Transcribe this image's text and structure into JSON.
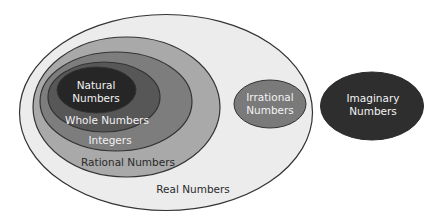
{
  "diagram": {
    "colors": {
      "stroke": "#333333",
      "real": "#ececec",
      "rational": "#a9a9a9",
      "integers": "#7d7d7d",
      "whole": "#575757",
      "natural": "#262626",
      "irrational": "#7a7a7a",
      "imaginary": "#2e2e2e",
      "label_light": "#f2f2f2",
      "label_dark": "#2a2a2a"
    },
    "sets": {
      "real": {
        "label": "Real Numbers"
      },
      "rational": {
        "label": "Rational Numbers"
      },
      "integers": {
        "label": "Integers"
      },
      "whole": {
        "label": "Whole Numbers"
      },
      "natural": {
        "label_line1": "Natural",
        "label_line2": "Numbers"
      },
      "irrational": {
        "label_line1": "Irrational",
        "label_line2": "Numbers"
      },
      "imaginary": {
        "label_line1": "Imaginary",
        "label_line2": "Numbers"
      }
    },
    "relationships": [
      "Natural Numbers ⊂ Whole Numbers",
      "Whole Numbers ⊂ Integers",
      "Integers ⊂ Rational Numbers",
      "Rational Numbers ⊂ Real Numbers",
      "Irrational Numbers ⊂ Real Numbers",
      "Imaginary Numbers outside Real Numbers"
    ]
  }
}
